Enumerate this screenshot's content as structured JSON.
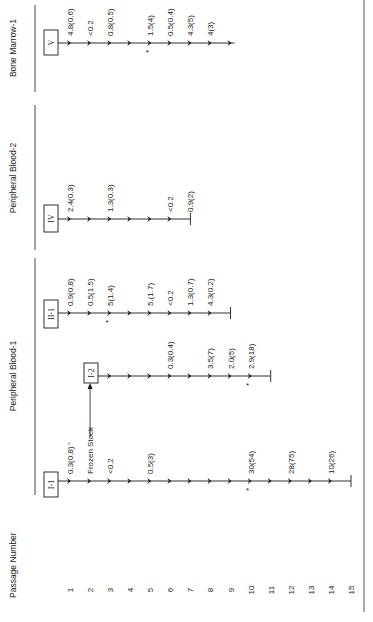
{
  "axis": {
    "label": "Passage Number",
    "passages": [
      "1",
      "2",
      "3",
      "4",
      "5",
      "6",
      "7",
      "8",
      "9",
      "10",
      "11",
      "12",
      "13",
      "14",
      "15"
    ]
  },
  "groups": [
    {
      "name": "Peripheral Blood-1",
      "bracket": [
        258,
        495
      ],
      "label_y": 376
    },
    {
      "name": "Peripheral Blood-2",
      "bracket": [
        105,
        250
      ],
      "label_y": 178
    },
    {
      "name": "Bone Marrow-1",
      "bracket": [
        5,
        92
      ],
      "label_y": 48
    }
  ],
  "frozen_stock_label": "Frozen Stock",
  "lines": [
    {
      "id": "I-1",
      "box_label": "I-1",
      "y": 481,
      "box": [
        44,
        472,
        14,
        25
      ],
      "start_x": 58,
      "arrows": [
        1,
        2,
        3,
        4,
        5,
        6,
        7,
        8,
        9,
        10,
        11,
        12,
        13,
        14
      ],
      "end_passage": 15,
      "end_tick": true,
      "labels": [
        {
          "passage": 1,
          "text": "0.3(0.8)⁺"
        },
        {
          "passage": 2,
          "text": "Frozen Stock"
        },
        {
          "passage": 3,
          "text": "<0.2"
        },
        {
          "passage": 5,
          "text": "0.5(3)"
        },
        {
          "passage": 10,
          "text": "30(54)"
        },
        {
          "passage": 12,
          "text": "28(75)"
        },
        {
          "passage": 14,
          "text": "10(26)"
        }
      ],
      "asterisks": [
        10
      ]
    },
    {
      "id": "I-2",
      "box_label": "I-2",
      "y": 376,
      "box": [
        84,
        363,
        14,
        20
      ],
      "start_x": 98,
      "arrows": [
        3,
        4,
        5,
        6,
        7,
        8,
        9,
        10
      ],
      "end_passage": 11,
      "end_tick": true,
      "labels": [
        {
          "passage": 6,
          "text": "0.3(0.4)"
        },
        {
          "passage": 8,
          "text": "3.5(7)"
        },
        {
          "passage": 9,
          "text": "2.0(5)"
        },
        {
          "passage": 10,
          "text": "2.9(18)"
        }
      ],
      "asterisks": [
        10
      ]
    },
    {
      "id": "II-1",
      "box_label": "II-1",
      "y": 313,
      "box": [
        44,
        300,
        14,
        28
      ],
      "start_x": 58,
      "arrows": [
        1,
        2,
        3,
        4,
        5,
        6,
        7,
        8
      ],
      "end_passage": 9,
      "end_tick": true,
      "labels": [
        {
          "passage": 1,
          "text": "0.9(0.8)"
        },
        {
          "passage": 2,
          "text": "0.5(1.5)"
        },
        {
          "passage": 3,
          "text": "5(1.4)"
        },
        {
          "passage": 5,
          "text": "5.(1.7)"
        },
        {
          "passage": 6,
          "text": "<0.2"
        },
        {
          "passage": 7,
          "text": "1.3(0.7)"
        },
        {
          "passage": 8,
          "text": "4.3(0.2)"
        }
      ],
      "asterisks": [
        3
      ]
    },
    {
      "id": "IV",
      "box_label": "IV",
      "y": 219,
      "box": [
        44,
        205,
        14,
        27
      ],
      "start_x": 58,
      "arrows": [
        1,
        2,
        3,
        4,
        5,
        6
      ],
      "end_passage": 7,
      "end_tick": true,
      "labels": [
        {
          "passage": 1,
          "text": "2.4(0.3)"
        },
        {
          "passage": 3,
          "text": "1.3(0.3)"
        },
        {
          "passage": 6,
          "text": "<0.2"
        },
        {
          "passage": 7,
          "text": "0.9(2)"
        }
      ],
      "asterisks": []
    },
    {
      "id": "V",
      "box_label": "V",
      "y": 43,
      "box": [
        44,
        30,
        14,
        25
      ],
      "start_x": 58,
      "arrows": [
        1,
        2,
        3,
        4,
        5,
        6,
        7,
        8,
        9
      ],
      "end_passage": 9,
      "end_tick": false,
      "labels": [
        {
          "passage": 1,
          "text": "4.8(0.6)"
        },
        {
          "passage": 2,
          "text": "<0.2"
        },
        {
          "passage": 3,
          "text": "0.8(0.5)"
        },
        {
          "passage": 5,
          "text": "1.5(4)"
        },
        {
          "passage": 6,
          "text": "0.5(0.4)"
        },
        {
          "passage": 7,
          "text": "4.3(5)"
        },
        {
          "passage": 8,
          "text": "4(3)"
        }
      ],
      "asterisks": [
        5
      ]
    }
  ],
  "colors": {
    "ink": "#1a1a1a",
    "paper": "#ffffff",
    "border": "#555555"
  }
}
